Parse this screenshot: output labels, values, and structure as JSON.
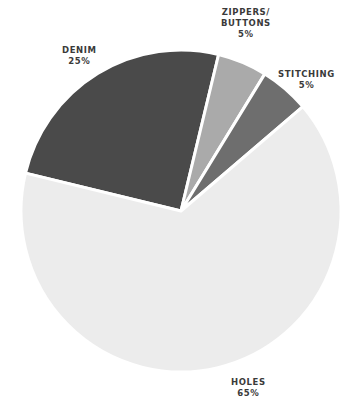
{
  "chart_data": {
    "type": "pie",
    "title": "",
    "categories": [
      "DENIM",
      "ZIPPERS/ BUTTONS",
      "STITCHING",
      "HOLES"
    ],
    "values": [
      25,
      5,
      5,
      65
    ],
    "value_labels": [
      "25%",
      "5%",
      "5%",
      "65%"
    ],
    "colors": [
      "#4a4a4a",
      "#aaaaaa",
      "#6e6e6e",
      "#ececec"
    ],
    "start_angle_deg": 193.6,
    "legend": "none",
    "slice_labels": "outside"
  },
  "labels": {
    "denim": {
      "name": "DENIM",
      "value": "25%"
    },
    "zippers": {
      "line1": "ZIPPERS/",
      "line2": "BUTTONS",
      "value": "5%"
    },
    "stitching": {
      "name": "STITCHING",
      "value": "5%"
    },
    "holes": {
      "name": "HOLES",
      "value": "65%"
    }
  }
}
